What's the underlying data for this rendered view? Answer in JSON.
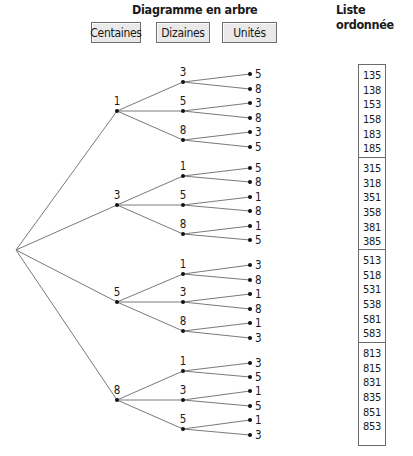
{
  "titles": {
    "tree": "Diagramme en arbre",
    "list": "Liste ordonnée"
  },
  "buttons": {
    "hundreds": "Centaines",
    "tens": "Dizaines",
    "units": "Unités"
  },
  "tree": {
    "root": {
      "x": 16,
      "y": 250
    },
    "level1_x": 117,
    "level2_x": 183,
    "level3_x": 250,
    "branches": [
      {
        "digit": "1",
        "y": 111,
        "children": [
          {
            "digit": "3",
            "y": 82,
            "leaves": [
              {
                "digit": "5",
                "y": 74
              },
              {
                "digit": "8",
                "y": 89
              }
            ]
          },
          {
            "digit": "5",
            "y": 111,
            "leaves": [
              {
                "digit": "3",
                "y": 103
              },
              {
                "digit": "8",
                "y": 118
              }
            ]
          },
          {
            "digit": "8",
            "y": 140,
            "leaves": [
              {
                "digit": "3",
                "y": 132
              },
              {
                "digit": "5",
                "y": 147
              }
            ]
          }
        ]
      },
      {
        "digit": "3",
        "y": 205,
        "children": [
          {
            "digit": "1",
            "y": 176,
            "leaves": [
              {
                "digit": "5",
                "y": 168
              },
              {
                "digit": "8",
                "y": 182
              }
            ]
          },
          {
            "digit": "5",
            "y": 205,
            "leaves": [
              {
                "digit": "1",
                "y": 197
              },
              {
                "digit": "8",
                "y": 211
              }
            ]
          },
          {
            "digit": "8",
            "y": 234,
            "leaves": [
              {
                "digit": "1",
                "y": 226
              },
              {
                "digit": "5",
                "y": 240
              }
            ]
          }
        ]
      },
      {
        "digit": "5",
        "y": 302,
        "children": [
          {
            "digit": "1",
            "y": 274,
            "leaves": [
              {
                "digit": "3",
                "y": 265
              },
              {
                "digit": "8",
                "y": 280
              }
            ]
          },
          {
            "digit": "3",
            "y": 302,
            "leaves": [
              {
                "digit": "1",
                "y": 294
              },
              {
                "digit": "8",
                "y": 309
              }
            ]
          },
          {
            "digit": "8",
            "y": 331,
            "leaves": [
              {
                "digit": "1",
                "y": 323
              },
              {
                "digit": "3",
                "y": 338
              }
            ]
          }
        ]
      },
      {
        "digit": "8",
        "y": 400,
        "children": [
          {
            "digit": "1",
            "y": 371,
            "leaves": [
              {
                "digit": "3",
                "y": 363
              },
              {
                "digit": "5",
                "y": 377
              }
            ]
          },
          {
            "digit": "3",
            "y": 400,
            "leaves": [
              {
                "digit": "1",
                "y": 391
              },
              {
                "digit": "5",
                "y": 406
              }
            ]
          },
          {
            "digit": "5",
            "y": 429,
            "leaves": [
              {
                "digit": "1",
                "y": 420
              },
              {
                "digit": "3",
                "y": 435
              }
            ]
          }
        ]
      }
    ]
  },
  "ordered_list": {
    "groups": [
      [
        "135",
        "138",
        "153",
        "158",
        "183",
        "185"
      ],
      [
        "315",
        "318",
        "351",
        "358",
        "381",
        "385"
      ],
      [
        "513",
        "518",
        "531",
        "538",
        "581",
        "583"
      ],
      [
        "813",
        "815",
        "831",
        "835",
        "851",
        "853"
      ]
    ]
  },
  "colors": {
    "line": "#7a7a7a",
    "dot": "#111111",
    "button_bg": "#e9e9e9",
    "button_border": "#6f6f6f"
  }
}
